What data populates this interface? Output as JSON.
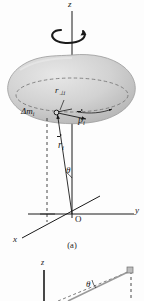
{
  "figure": {
    "background_color": "#fdfdfd",
    "ink_color": "#1a1a1a",
    "body_fill_color": "#c9c9c9",
    "body_edge_color": "#8e8e8e"
  },
  "panel_a": {
    "caption": "(a)",
    "labels": {
      "z_axis": "z",
      "y_axis": "y",
      "x_axis": "x",
      "origin": "O",
      "r_perp": "r",
      "r_perp_sub": "⊥i",
      "mass_element": "Δm",
      "mass_element_sub": "i",
      "momentum_vector": "p",
      "momentum_vector_sub": "i",
      "position_vector": "r",
      "position_vector_sub": "i",
      "angle": "θ"
    },
    "icons": {
      "rotation_arrow": "rotation-arrow-icon",
      "dashed_circle": "dashed-orbit-icon",
      "mass_point": "mass-point-dot-icon"
    }
  },
  "panel_b": {
    "labels": {
      "z_axis": "z",
      "angle": "θ"
    }
  }
}
